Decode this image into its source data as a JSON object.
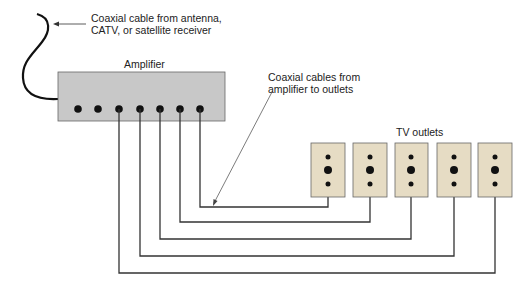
{
  "labels": {
    "source_line1": "Coaxial cable from antenna,",
    "source_line2": "CATV, or satellite receiver",
    "amplifier": "Amplifier",
    "cables_line1": "Coaxial cables from",
    "cables_line2": "amplifier to outlets",
    "outlets": "TV outlets"
  },
  "colors": {
    "amplifier_fill": "#c8c8c8",
    "outlet_fill": "#e6dcc4",
    "line": "#333333",
    "dot": "#111111"
  },
  "amplifier": {
    "port_count": 7,
    "connected_ports": 5
  },
  "outlets": {
    "count": 5
  }
}
